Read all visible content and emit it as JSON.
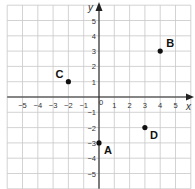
{
  "chart_data": {
    "type": "scatter",
    "title": "",
    "xlabel": "x",
    "ylabel": "y",
    "xlim": [
      -6,
      6
    ],
    "ylim": [
      -6,
      6
    ],
    "grid": true,
    "x_ticks": [
      -5,
      -4,
      -3,
      -2,
      -1,
      0,
      1,
      2,
      3,
      4,
      5
    ],
    "y_ticks": [
      -5,
      -4,
      -3,
      -2,
      -1,
      1,
      2,
      3,
      4,
      5
    ],
    "points": [
      {
        "label": "A",
        "x": 0,
        "y": -3
      },
      {
        "label": "B",
        "x": 4,
        "y": 3
      },
      {
        "label": "C",
        "x": -2,
        "y": 1
      },
      {
        "label": "D",
        "x": 3,
        "y": -2
      }
    ]
  },
  "colors": {
    "grid": "#c8c8c8",
    "axis": "#222222",
    "point": "#111111",
    "text": "#333333"
  }
}
